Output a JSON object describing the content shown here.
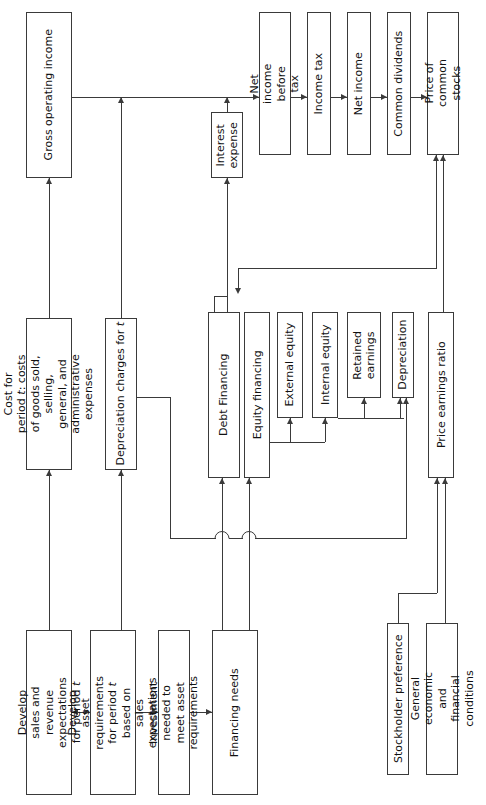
{
  "diagram": {
    "orientation": "rotated-90-ccw",
    "line_color": "#3a3a3a",
    "box_fill": "#ffffff",
    "nodes": [
      {
        "id": "gross_operating_income",
        "label": "Gross operating income"
      },
      {
        "id": "cost_for_period",
        "label": "Cost for period t: costs of goods sold, selling, general, and administrative expenses"
      },
      {
        "id": "depreciation_charges",
        "label": "Depreciation charges for t"
      },
      {
        "id": "develop_sales",
        "label": "Develop sales and revenue expectations for period t"
      },
      {
        "id": "develop_asset_requirements",
        "label": "Develop asset requirements for period t based on sales expectations"
      },
      {
        "id": "investment_needed",
        "label": "Investment needed to meet asset requirements"
      },
      {
        "id": "financing_needs",
        "label": "Financing needs"
      },
      {
        "id": "interest_expense",
        "label": "Interest expense"
      },
      {
        "id": "net_income_before_tax",
        "label": "Net income before tax"
      },
      {
        "id": "income_tax",
        "label": "Income tax"
      },
      {
        "id": "net_income",
        "label": "Net income"
      },
      {
        "id": "common_dividends",
        "label": "Common dividends"
      },
      {
        "id": "price_of_common_stocks",
        "label": "Price of common stocks"
      },
      {
        "id": "debt_financing",
        "label": "Debt Financing"
      },
      {
        "id": "equity_financing",
        "label": "Equity financing"
      },
      {
        "id": "external_equity",
        "label": "External equity"
      },
      {
        "id": "internal_equity",
        "label": "Internal equity"
      },
      {
        "id": "retained_earnings",
        "label": "Retained earnings"
      },
      {
        "id": "depreciation",
        "label": "Depreciation"
      },
      {
        "id": "price_earnings_ratio",
        "label": "Price earnings ratio"
      },
      {
        "id": "stockholder_preference",
        "label": "Stockholder preference"
      },
      {
        "id": "general_economic",
        "label": "General economic and financial conditions"
      }
    ],
    "edges": [
      {
        "from": "develop_sales",
        "to": "develop_asset_requirements",
        "style": "double"
      },
      {
        "from": "develop_asset_requirements",
        "to": "investment_needed",
        "style": "single"
      },
      {
        "from": "investment_needed",
        "to": "financing_needs",
        "style": "single"
      },
      {
        "from": "develop_sales",
        "to": "cost_for_period",
        "style": "single"
      },
      {
        "from": "cost_for_period",
        "to": "gross_operating_income",
        "style": "single"
      },
      {
        "from": "develop_asset_requirements",
        "to": "depreciation_charges",
        "style": "single"
      },
      {
        "from": "depreciation_charges",
        "to": "net_income_before_tax",
        "style": "single"
      },
      {
        "from": "gross_operating_income",
        "to": "net_income_before_tax",
        "style": "single"
      },
      {
        "from": "interest_expense",
        "to": "net_income_before_tax",
        "style": "single"
      },
      {
        "from": "debt_financing",
        "to": "interest_expense",
        "style": "single"
      },
      {
        "from": "net_income_before_tax",
        "to": "income_tax",
        "style": "single"
      },
      {
        "from": "income_tax",
        "to": "net_income",
        "style": "single"
      },
      {
        "from": "net_income",
        "to": "common_dividends",
        "style": "single"
      },
      {
        "from": "common_dividends",
        "to": "price_of_common_stocks",
        "style": "single"
      },
      {
        "from": "price_earnings_ratio",
        "to": "price_of_common_stocks",
        "style": "single"
      },
      {
        "from": "financing_needs",
        "to": "debt_financing",
        "style": "single"
      },
      {
        "from": "financing_needs",
        "to": "equity_financing",
        "style": "single"
      },
      {
        "from": "equity_financing",
        "to": "external_equity",
        "style": "single"
      },
      {
        "from": "equity_financing",
        "to": "internal_equity",
        "style": "single"
      },
      {
        "from": "internal_equity",
        "to": "retained_earnings",
        "style": "single"
      },
      {
        "from": "internal_equity",
        "to": "depreciation",
        "style": "single"
      },
      {
        "from": "depreciation_charges",
        "to": "depreciation",
        "style": "single"
      },
      {
        "from": "stockholder_preference",
        "to": "price_earnings_ratio",
        "style": "single"
      },
      {
        "from": "general_economic",
        "to": "price_earnings_ratio",
        "style": "single"
      },
      {
        "from": "price_of_common_stocks",
        "to": "debt_financing",
        "style": "single"
      }
    ]
  }
}
